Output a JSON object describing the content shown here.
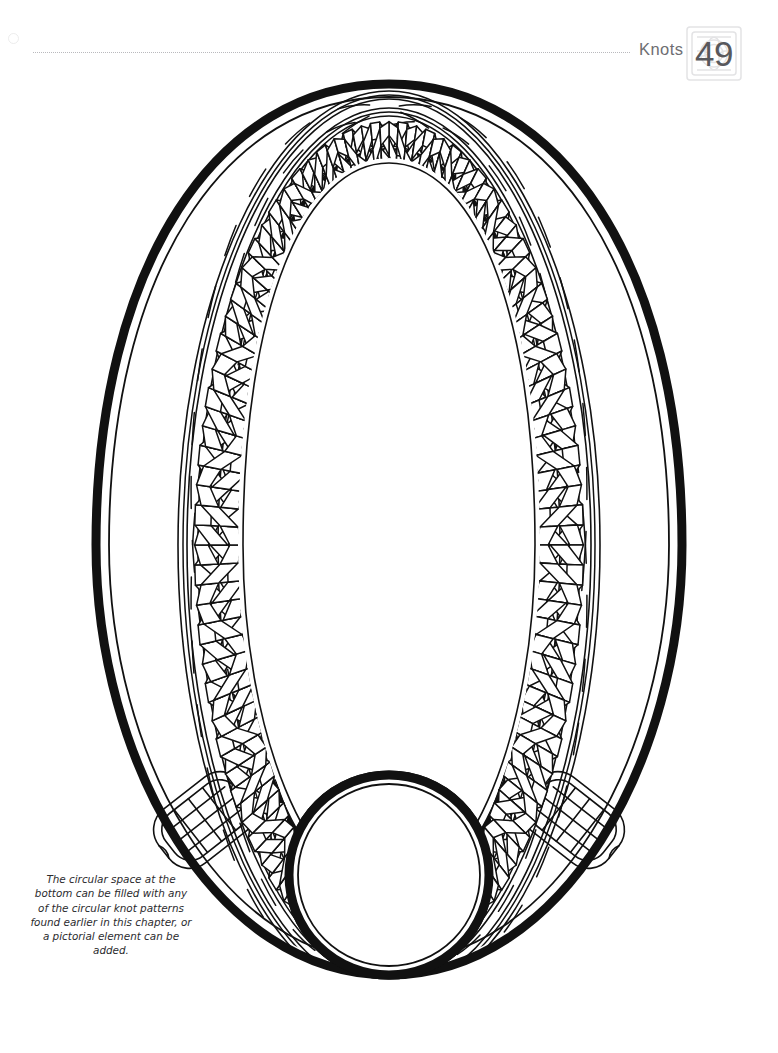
{
  "page": {
    "width": 778,
    "height": 1053,
    "background_color": "#ffffff"
  },
  "header": {
    "chapter_label": "Knots",
    "page_number": "49",
    "rule_style": "dotted",
    "rule_color": "#b9b9bd",
    "label_color": "#6e6e72",
    "badge_watermark": "celtic-knot-square-watermark",
    "badge_watermark_color": "#e3e3e5",
    "corner_mark": "faint-circle-mark"
  },
  "artwork": {
    "title": "Celtic knotwork oval frame",
    "description": "Large oval frame formed of a plaited Celtic knot band between heavy black outlines, with a blank circular medallion at the bottom.",
    "ink_color": "#111111",
    "fill_color": "#ffffff",
    "elements": [
      {
        "name": "outer-oval-stroke",
        "type": "oval",
        "role": "heavy outer border"
      },
      {
        "name": "knot-band",
        "type": "plait",
        "role": "interlaced four-strand braid filling the ring"
      },
      {
        "name": "inner-oval-stroke",
        "type": "oval",
        "role": "heavy inner border enclosing blank field"
      },
      {
        "name": "bottom-left-knot-panel",
        "type": "square-knot",
        "role": "woven panel at lower left"
      },
      {
        "name": "bottom-right-knot-panel",
        "type": "square-knot",
        "role": "woven panel at lower right"
      },
      {
        "name": "bottom-circle-medallion",
        "type": "circle",
        "role": "blank circular space for added design"
      }
    ]
  },
  "caption": {
    "text": "The circular space at the bottom can be filled with any of the circular knot patterns found earlier in this chapter, or a pictorial element can be added.",
    "color": "#2b2b2e",
    "style": "italic"
  }
}
